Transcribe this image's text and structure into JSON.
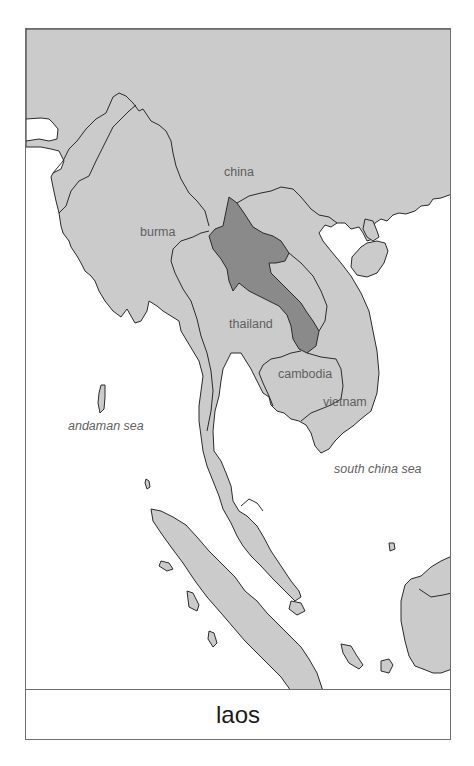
{
  "map": {
    "title": "laos",
    "highlighted_country": "laos",
    "countries": [
      {
        "id": "china",
        "label": "china"
      },
      {
        "id": "burma",
        "label": "burma"
      },
      {
        "id": "thailand",
        "label": "thailand"
      },
      {
        "id": "cambodia",
        "label": "cambodia"
      },
      {
        "id": "vietnam",
        "label": "vietnam"
      }
    ],
    "seas": [
      {
        "id": "andaman-sea",
        "label": "andaman sea"
      },
      {
        "id": "south-china-sea",
        "label": "south china sea"
      }
    ],
    "colors": {
      "land": "#cbcbcb",
      "highlight": "#8a8a8a",
      "water": "#ffffff",
      "border": "#2a2a2a",
      "label": "#5f5f5f"
    }
  }
}
